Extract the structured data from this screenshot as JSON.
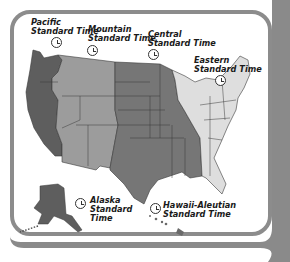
{
  "map": {
    "title": "United States Time Zones",
    "colors": {
      "pacific": "#5e5e5e",
      "mountain": "#9c9c9c",
      "central": "#767676",
      "eastern": "#dedede",
      "frame": "#8c8c8c",
      "borders": "#3a3a3a"
    },
    "zones": [
      {
        "id": "pacific",
        "label": "Pacific\nStandard Time"
      },
      {
        "id": "mountain",
        "label": "Mountain\nStandard Time"
      },
      {
        "id": "central",
        "label": "Central\nStandard Time"
      },
      {
        "id": "eastern",
        "label": "Eastern\nStandard Time"
      },
      {
        "id": "alaska",
        "label": "Alaska\nStandard\nTime"
      },
      {
        "id": "hawaii",
        "label": "Hawaii-Aleutian\nStandard Time"
      }
    ]
  }
}
